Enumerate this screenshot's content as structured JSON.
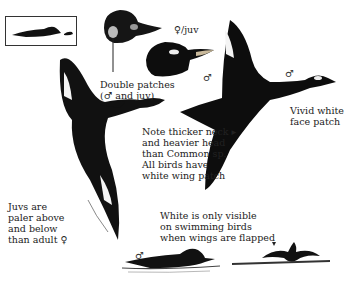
{
  "plate": {
    "subject": "Velvet Scoter identification plate",
    "symbols": {
      "male": "♂",
      "female_juv": "♀/juv"
    },
    "labels": {
      "double_patches": "Double patches\n(♂ and juv)",
      "female_juv": "♀/juv",
      "male_head": "♂",
      "male_flight": "♂",
      "male_flight_right": "♂",
      "vivid_face": "Vivid white\nface patch",
      "thicker_neck": "Note thicker neck ▸\nand heavier head\nthan Common sp.\nAll birds have\nwhite wing patch",
      "juvs_paler": "Juvs are\npaler above\nand below\nthan adult ♀",
      "white_visible": "White is only visible\non swimming birds\nwhen wings are flapped",
      "swimming_male": "♂"
    },
    "colors": {
      "ink": "#111111",
      "paper": "#ffffff",
      "patch": "#f4f4f4",
      "bill": "#c8b89a"
    }
  }
}
